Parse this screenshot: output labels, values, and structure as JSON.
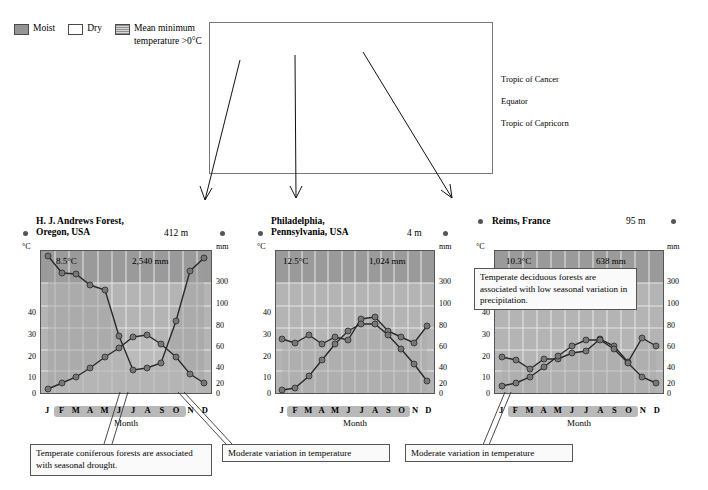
{
  "legend": {
    "items": [
      {
        "label": "Moist",
        "swatch": "moist-swatch"
      },
      {
        "label": "Dry",
        "swatch": "dry-swatch"
      },
      {
        "label": "Mean minimum temperature >0°C",
        "swatch": "mean-min-temp-swatch"
      }
    ]
  },
  "map": {
    "lines": [
      {
        "name": "tropic-of-cancer",
        "label": "Tropic of Cancer"
      },
      {
        "name": "equator",
        "label": "Equator"
      },
      {
        "name": "tropic-of-capricorn",
        "label": "Tropic of Capricorn"
      }
    ]
  },
  "axes": {
    "temp_unit": "°C",
    "precip_unit": "mm",
    "temp_ticks": [
      "40",
      "30",
      "20",
      "10",
      "0"
    ],
    "precip_ticks": [
      "300",
      "100",
      "80",
      "60",
      "40",
      "20",
      "0"
    ],
    "months": [
      "J",
      "F",
      "M",
      "A",
      "M",
      "J",
      "J",
      "A",
      "S",
      "O",
      "N",
      "D"
    ],
    "month_caption": "Month"
  },
  "charts": [
    {
      "id": "hj-andrews",
      "title_line1": "H. J. Andrews Forest,",
      "title_line2": "Oregon, USA",
      "elevation": "412 m",
      "mean_temp": "8.5°C",
      "annual_precip": "2,540 mm",
      "warm_band": {
        "start_month": "M",
        "end_month": "N"
      },
      "callout": "Temperate coniferous forests are associated with seasonal drought."
    },
    {
      "id": "philadelphia",
      "title_line1": "Philadelphia,",
      "title_line2": "Pennsylvania, USA",
      "elevation": "4 m",
      "mean_temp": "12.5°C",
      "annual_precip": "1,024 mm",
      "warm_band": {
        "start_month": "M",
        "end_month": "N"
      },
      "callout": "Moderate variation in temperature"
    },
    {
      "id": "reims",
      "title_line1": "Reims, France",
      "title_line2": "",
      "elevation": "95 m",
      "mean_temp": "10.3°C",
      "annual_precip": "638 mm",
      "warm_band": {
        "start_month": "M",
        "end_month": "N"
      },
      "callout_top": "Temperate deciduous forests are associated with low seasonal variation in precipitation.",
      "callout": "Moderate variation in temperature"
    }
  ],
  "chart_data": [
    {
      "type": "line",
      "title": "H. J. Andrews Forest, Oregon, USA",
      "subtitle": "412 m",
      "xlabel": "Month",
      "ylabel": "°C",
      "y2label": "mm",
      "categories": [
        "J",
        "F",
        "M",
        "A",
        "M",
        "J",
        "J",
        "A",
        "S",
        "O",
        "N",
        "D"
      ],
      "ylim": [
        0,
        50
      ],
      "y2lim": [
        0,
        400
      ],
      "grid": true,
      "legend": "none",
      "series": [
        {
          "name": "Precipitation (mm)",
          "axis": "right",
          "values": [
            360,
            300,
            295,
            255,
            240,
            130,
            40,
            45,
            65,
            170,
            330,
            355
          ]
        },
        {
          "name": "Temperature (°C)",
          "axis": "left",
          "values": [
            0.5,
            2,
            4,
            6.5,
            10,
            13,
            16.5,
            17,
            14.5,
            10,
            5,
            2
          ]
        }
      ],
      "annotations": [
        "8.5°C",
        "2,540 mm"
      ]
    },
    {
      "type": "line",
      "title": "Philadelphia, Pennsylvania, USA",
      "subtitle": "4 m",
      "xlabel": "Month",
      "ylabel": "°C",
      "y2label": "mm",
      "categories": [
        "J",
        "F",
        "M",
        "A",
        "M",
        "J",
        "J",
        "A",
        "S",
        "O",
        "N",
        "D"
      ],
      "ylim": [
        0,
        50
      ],
      "y2lim": [
        0,
        400
      ],
      "grid": true,
      "legend": "none",
      "series": [
        {
          "name": "Precipitation (mm)",
          "axis": "right",
          "values": [
            78,
            72,
            85,
            74,
            82,
            78,
            105,
            108,
            88,
            80,
            72,
            92
          ]
        },
        {
          "name": "Temperature (°C)",
          "axis": "left",
          "values": [
            0.5,
            1.5,
            6,
            12,
            17.5,
            22.5,
            25,
            25,
            21,
            15,
            9,
            3
          ]
        }
      ],
      "annotations": [
        "12.5°C",
        "1,024 mm"
      ]
    },
    {
      "type": "line",
      "title": "Reims, France",
      "subtitle": "95 m",
      "xlabel": "Month",
      "ylabel": "°C",
      "y2label": "mm",
      "categories": [
        "J",
        "F",
        "M",
        "A",
        "M",
        "J",
        "J",
        "A",
        "S",
        "O",
        "N",
        "D"
      ],
      "ylim": [
        0,
        50
      ],
      "y2lim": [
        0,
        400
      ],
      "grid": true,
      "legend": "none",
      "series": [
        {
          "name": "Precipitation (mm)",
          "axis": "right",
          "values": [
            50,
            47,
            38,
            48,
            48,
            54,
            56,
            68,
            60,
            45,
            69,
            60
          ]
        },
        {
          "name": "Temperature (°C)",
          "axis": "left",
          "values": [
            2.5,
            3.5,
            6,
            9.5,
            13.5,
            17,
            19,
            19,
            16,
            11,
            6,
            3
          ]
        }
      ],
      "annotations": [
        "10.3°C",
        "638 mm"
      ]
    }
  ]
}
